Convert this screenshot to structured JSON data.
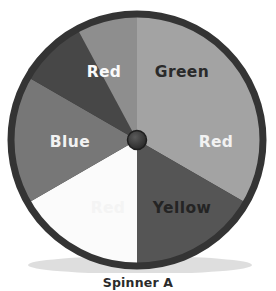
{
  "figure": {
    "caption": "Spinner A",
    "background_color": "#ffffff"
  },
  "spinner": {
    "center_x": 133,
    "center_y": 133,
    "radius": 128,
    "rim_color": "#3a3a3a",
    "rim_width": 9,
    "rim_highlight_color": "#8a8a8a",
    "hub_color": "#2e2e2e",
    "hub_radius": 9,
    "hub_inner_color": "#4a4a4a",
    "sector_count": 6,
    "sector_angle_degrees": 60,
    "sectors": [
      {
        "label": "Green",
        "fill": "#a3a3a3",
        "text_color": "#2a2a2a",
        "start_angle": 0,
        "end_angle": 60,
        "label_x": 178,
        "label_y": 70
      },
      {
        "label": "Red",
        "fill": "#555555",
        "text_color": "#f2f2f2",
        "start_angle": 60,
        "end_angle": 120,
        "label_x": 212,
        "label_y": 140
      },
      {
        "label": "Yellow",
        "fill": "#fbfbfb",
        "text_color": "#242424",
        "start_angle": 120,
        "end_angle": 180,
        "label_x": 178,
        "label_y": 206
      },
      {
        "label": "Red",
        "fill": "#777777",
        "text_color": "#f4f4f4",
        "start_angle": 180,
        "end_angle": 240,
        "label_x": 104,
        "label_y": 206
      },
      {
        "label": "Blue",
        "fill": "#474747",
        "text_color": "#f2f2f2",
        "start_angle": 240,
        "end_angle": 300,
        "label_x": 66,
        "label_y": 140
      },
      {
        "label": "Red",
        "fill": "#8e8e8e",
        "text_color": "#fafafa",
        "start_angle": 300,
        "end_angle": 360,
        "label_x": 100,
        "label_y": 70
      }
    ]
  }
}
